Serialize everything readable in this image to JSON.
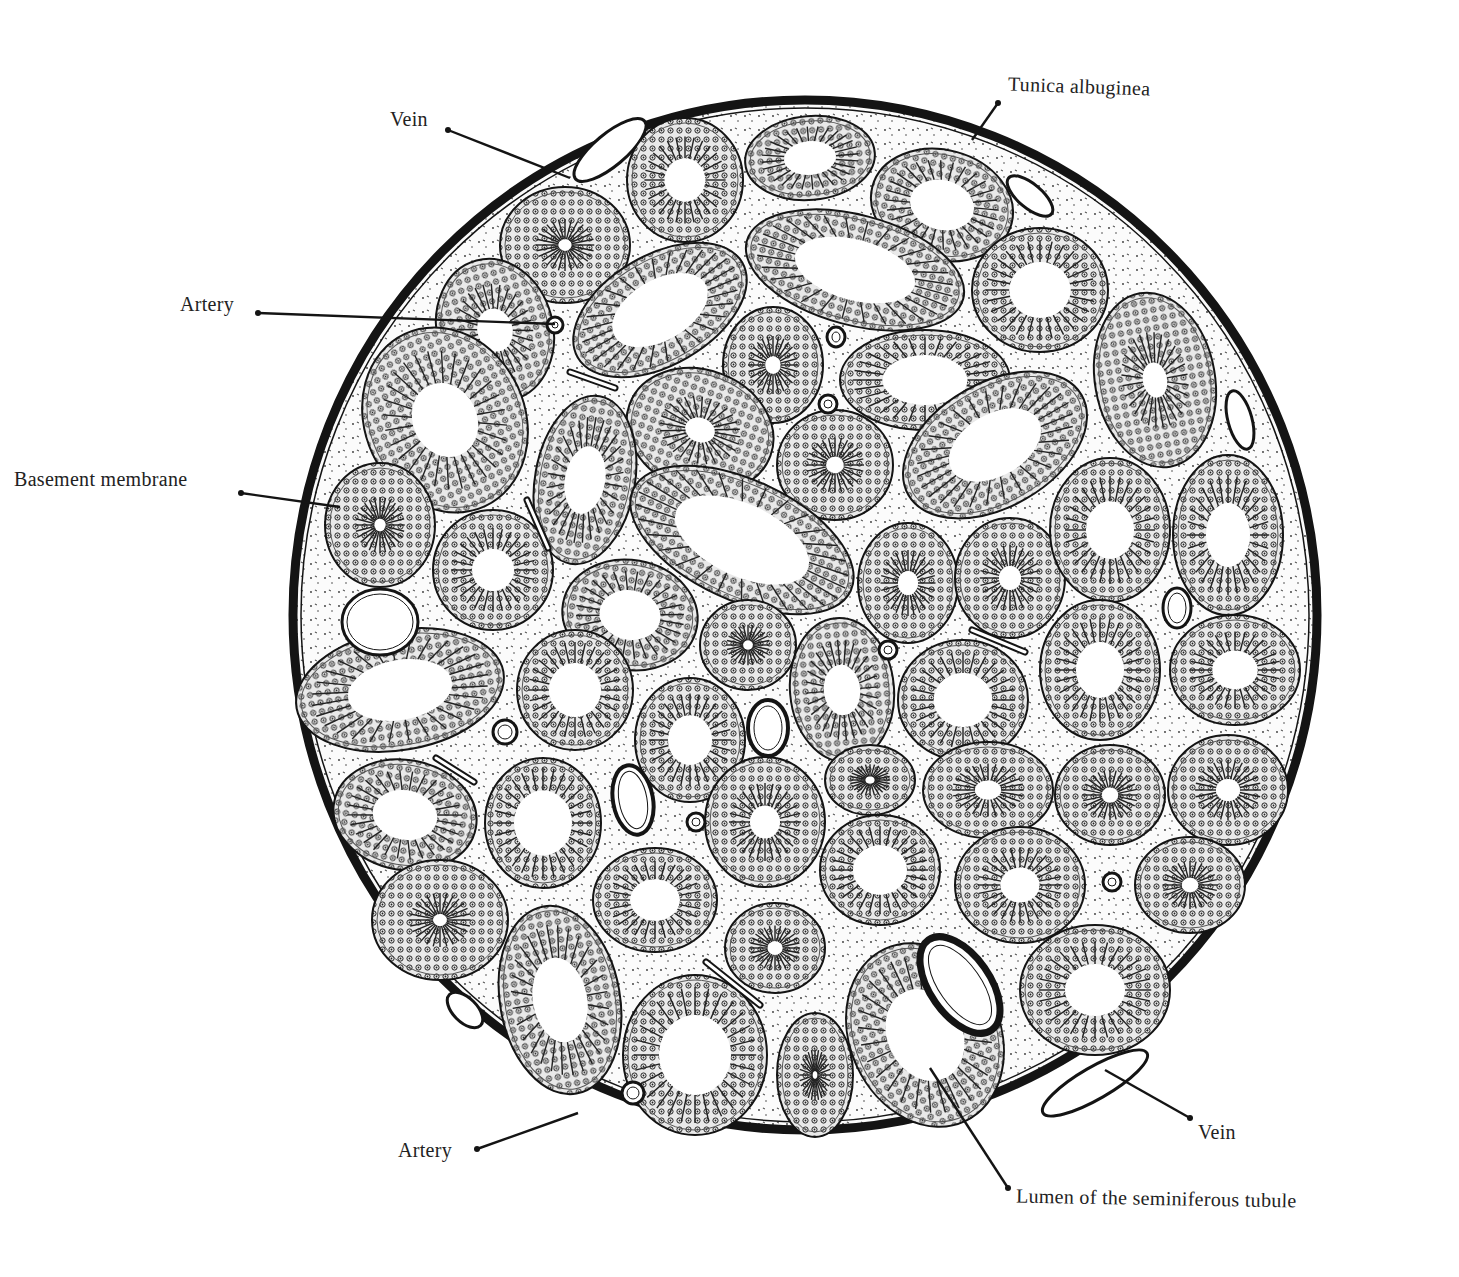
{
  "figure": {
    "background": "#ffffff",
    "ink": "#141414",
    "stroma_fill": "#fbfbfb",
    "capsule": {
      "cx": 805,
      "cy": 615,
      "rx": 512,
      "ry": 515,
      "stroke_width": 9
    }
  },
  "labels": [
    {
      "id": "vein-top",
      "text": "Vein",
      "x": 390,
      "y": 108,
      "line": [
        448,
        130,
        570,
        178
      ]
    },
    {
      "id": "tunica-albuginea",
      "text": "Tunica albuginea",
      "x": 1008,
      "y": 75,
      "line": [
        998,
        103,
        972,
        140
      ]
    },
    {
      "id": "artery-top",
      "text": "Artery",
      "x": 180,
      "y": 293,
      "line": [
        258,
        313,
        555,
        324
      ]
    },
    {
      "id": "basement-membrane",
      "text": "Basement membrane",
      "x": 14,
      "y": 468,
      "line": [
        241,
        493,
        340,
        507
      ]
    },
    {
      "id": "artery-bottom",
      "text": "Artery",
      "x": 398,
      "y": 1139,
      "line": [
        477,
        1149,
        578,
        1113
      ]
    },
    {
      "id": "vein-bottom",
      "text": "Vein",
      "x": 1198,
      "y": 1121,
      "line": [
        1190,
        1118,
        1105,
        1070
      ]
    },
    {
      "id": "lumen",
      "text": "Lumen of the seminiferous tubule",
      "x": 1016,
      "y": 1187,
      "line": [
        1008,
        1188,
        930,
        1068
      ]
    }
  ],
  "tubules": [
    {
      "cx": 685,
      "cy": 180,
      "rx": 58,
      "ry": 62,
      "rot": 0,
      "lumen": 0.35
    },
    {
      "cx": 810,
      "cy": 158,
      "rx": 65,
      "ry": 42,
      "rot": -5,
      "lumen": 0.4
    },
    {
      "cx": 942,
      "cy": 205,
      "rx": 72,
      "ry": 55,
      "rot": 15,
      "lumen": 0.45
    },
    {
      "cx": 565,
      "cy": 245,
      "rx": 65,
      "ry": 58,
      "rot": 0,
      "lumen": 0.1
    },
    {
      "cx": 855,
      "cy": 270,
      "rx": 112,
      "ry": 55,
      "rot": 15,
      "lumen": 0.55
    },
    {
      "cx": 1040,
      "cy": 290,
      "rx": 68,
      "ry": 62,
      "rot": 0,
      "lumen": 0.45
    },
    {
      "cx": 660,
      "cy": 310,
      "rx": 95,
      "ry": 55,
      "rot": -30,
      "lumen": 0.55
    },
    {
      "cx": 495,
      "cy": 330,
      "rx": 58,
      "ry": 72,
      "rot": -15,
      "lumen": 0.3
    },
    {
      "cx": 773,
      "cy": 365,
      "rx": 50,
      "ry": 58,
      "rot": 0,
      "lumen": 0.15
    },
    {
      "cx": 925,
      "cy": 380,
      "rx": 85,
      "ry": 50,
      "rot": 0,
      "lumen": 0.5
    },
    {
      "cx": 1155,
      "cy": 380,
      "rx": 60,
      "ry": 88,
      "rot": -10,
      "lumen": 0.2
    },
    {
      "cx": 445,
      "cy": 420,
      "rx": 80,
      "ry": 95,
      "rot": -25,
      "lumen": 0.4
    },
    {
      "cx": 700,
      "cy": 430,
      "rx": 75,
      "ry": 60,
      "rot": 20,
      "lumen": 0.2
    },
    {
      "cx": 585,
      "cy": 480,
      "rx": 50,
      "ry": 85,
      "rot": 10,
      "lumen": 0.4
    },
    {
      "cx": 835,
      "cy": 465,
      "rx": 58,
      "ry": 55,
      "rot": 0,
      "lumen": 0.15
    },
    {
      "cx": 995,
      "cy": 445,
      "rx": 100,
      "ry": 62,
      "rot": -30,
      "lumen": 0.5
    },
    {
      "cx": 742,
      "cy": 540,
      "rx": 120,
      "ry": 60,
      "rot": 25,
      "lumen": 0.6
    },
    {
      "cx": 380,
      "cy": 525,
      "rx": 55,
      "ry": 62,
      "rot": 0,
      "lumen": 0.1
    },
    {
      "cx": 493,
      "cy": 570,
      "rx": 60,
      "ry": 60,
      "rot": 0,
      "lumen": 0.35
    },
    {
      "cx": 908,
      "cy": 583,
      "rx": 50,
      "ry": 60,
      "rot": 0,
      "lumen": 0.2
    },
    {
      "cx": 1010,
      "cy": 578,
      "rx": 55,
      "ry": 60,
      "rot": 0,
      "lumen": 0.2
    },
    {
      "cx": 1110,
      "cy": 530,
      "rx": 60,
      "ry": 72,
      "rot": 0,
      "lumen": 0.4
    },
    {
      "cx": 1228,
      "cy": 535,
      "rx": 55,
      "ry": 80,
      "rot": 0,
      "lumen": 0.4
    },
    {
      "cx": 630,
      "cy": 615,
      "rx": 68,
      "ry": 55,
      "rot": 10,
      "lumen": 0.45
    },
    {
      "cx": 748,
      "cy": 645,
      "rx": 48,
      "ry": 45,
      "rot": 0,
      "lumen": 0.1
    },
    {
      "cx": 842,
      "cy": 690,
      "rx": 52,
      "ry": 72,
      "rot": -5,
      "lumen": 0.35
    },
    {
      "cx": 400,
      "cy": 690,
      "rx": 105,
      "ry": 60,
      "rot": -10,
      "lumen": 0.5
    },
    {
      "cx": 575,
      "cy": 690,
      "rx": 58,
      "ry": 60,
      "rot": 0,
      "lumen": 0.45
    },
    {
      "cx": 690,
      "cy": 740,
      "rx": 55,
      "ry": 62,
      "rot": 0,
      "lumen": 0.4
    },
    {
      "cx": 963,
      "cy": 700,
      "rx": 65,
      "ry": 60,
      "rot": 0,
      "lumen": 0.45
    },
    {
      "cx": 1100,
      "cy": 670,
      "rx": 60,
      "ry": 70,
      "rot": 0,
      "lumen": 0.4
    },
    {
      "cx": 1235,
      "cy": 670,
      "rx": 65,
      "ry": 55,
      "rot": 0,
      "lumen": 0.35
    },
    {
      "cx": 870,
      "cy": 780,
      "rx": 45,
      "ry": 35,
      "rot": 0,
      "lumen": 0.1
    },
    {
      "cx": 405,
      "cy": 815,
      "rx": 72,
      "ry": 55,
      "rot": 10,
      "lumen": 0.45
    },
    {
      "cx": 543,
      "cy": 823,
      "rx": 58,
      "ry": 65,
      "rot": 0,
      "lumen": 0.5
    },
    {
      "cx": 765,
      "cy": 822,
      "rx": 60,
      "ry": 65,
      "rot": 0,
      "lumen": 0.25
    },
    {
      "cx": 988,
      "cy": 790,
      "rx": 65,
      "ry": 48,
      "rot": 0,
      "lumen": 0.2
    },
    {
      "cx": 1110,
      "cy": 795,
      "rx": 55,
      "ry": 50,
      "rot": 0,
      "lumen": 0.15
    },
    {
      "cx": 1228,
      "cy": 790,
      "rx": 60,
      "ry": 55,
      "rot": 0,
      "lumen": 0.2
    },
    {
      "cx": 880,
      "cy": 870,
      "rx": 60,
      "ry": 55,
      "rot": 0,
      "lumen": 0.45
    },
    {
      "cx": 655,
      "cy": 900,
      "rx": 62,
      "ry": 52,
      "rot": 0,
      "lumen": 0.4
    },
    {
      "cx": 1020,
      "cy": 885,
      "rx": 65,
      "ry": 58,
      "rot": 0,
      "lumen": 0.3
    },
    {
      "cx": 1190,
      "cy": 885,
      "rx": 55,
      "ry": 48,
      "rot": 0,
      "lumen": 0.15
    },
    {
      "cx": 440,
      "cy": 920,
      "rx": 68,
      "ry": 60,
      "rot": 0,
      "lumen": 0.1
    },
    {
      "cx": 775,
      "cy": 948,
      "rx": 50,
      "ry": 45,
      "rot": 0,
      "lumen": 0.15
    },
    {
      "cx": 560,
      "cy": 1000,
      "rx": 60,
      "ry": 95,
      "rot": -10,
      "lumen": 0.45
    },
    {
      "cx": 695,
      "cy": 1055,
      "rx": 72,
      "ry": 80,
      "rot": 0,
      "lumen": 0.5
    },
    {
      "cx": 815,
      "cy": 1075,
      "rx": 38,
      "ry": 62,
      "rot": 0,
      "lumen": 0.05
    },
    {
      "cx": 925,
      "cy": 1035,
      "rx": 75,
      "ry": 95,
      "rot": -25,
      "lumen": 0.5
    },
    {
      "cx": 1095,
      "cy": 990,
      "rx": 75,
      "ry": 65,
      "rot": 0,
      "lumen": 0.4
    }
  ],
  "vessels": [
    {
      "type": "vein",
      "cx": 380,
      "cy": 622,
      "rx": 38,
      "ry": 33,
      "rot": 0,
      "wall": 3
    },
    {
      "type": "vein",
      "cx": 768,
      "cy": 728,
      "rx": 20,
      "ry": 28,
      "rot": 0,
      "wall": 4
    },
    {
      "type": "vein",
      "cx": 633,
      "cy": 800,
      "rx": 20,
      "ry": 35,
      "rot": -10,
      "wall": 4
    },
    {
      "type": "vein",
      "cx": 960,
      "cy": 985,
      "rx": 30,
      "ry": 55,
      "rot": -35,
      "wall": 7
    },
    {
      "type": "vein",
      "cx": 1177,
      "cy": 608,
      "rx": 14,
      "ry": 20,
      "rot": 0,
      "wall": 3
    },
    {
      "type": "artery",
      "cx": 555,
      "cy": 325,
      "rx": 8,
      "ry": 8,
      "rot": 0,
      "wall": 3
    },
    {
      "type": "artery",
      "cx": 836,
      "cy": 337,
      "rx": 9,
      "ry": 10,
      "rot": 0,
      "wall": 3
    },
    {
      "type": "artery",
      "cx": 828,
      "cy": 404,
      "rx": 9,
      "ry": 9,
      "rot": 0,
      "wall": 3
    },
    {
      "type": "artery",
      "cx": 888,
      "cy": 650,
      "rx": 9,
      "ry": 9,
      "rot": 0,
      "wall": 3
    },
    {
      "type": "artery",
      "cx": 505,
      "cy": 732,
      "rx": 12,
      "ry": 12,
      "rot": 0,
      "wall": 3
    },
    {
      "type": "artery",
      "cx": 696,
      "cy": 822,
      "rx": 9,
      "ry": 9,
      "rot": 0,
      "wall": 3
    },
    {
      "type": "artery",
      "cx": 1112,
      "cy": 882,
      "rx": 9,
      "ry": 9,
      "rot": 0,
      "wall": 3
    },
    {
      "type": "artery",
      "cx": 633,
      "cy": 1093,
      "rx": 11,
      "ry": 11,
      "rot": 0,
      "wall": 3
    }
  ],
  "capsule_veins": [
    {
      "cx": 610,
      "cy": 150,
      "rx": 45,
      "ry": 16,
      "rot": -40
    },
    {
      "cx": 1030,
      "cy": 196,
      "rx": 28,
      "ry": 12,
      "rot": 40
    },
    {
      "cx": 465,
      "cy": 1010,
      "rx": 22,
      "ry": 12,
      "rot": 45
    },
    {
      "cx": 1095,
      "cy": 1083,
      "rx": 60,
      "ry": 16,
      "rot": -30
    },
    {
      "cx": 1240,
      "cy": 420,
      "rx": 12,
      "ry": 30,
      "rot": -15
    }
  ],
  "capillaries": [
    {
      "x1": 570,
      "y1": 372,
      "x2": 615,
      "y2": 388
    },
    {
      "x1": 527,
      "y1": 500,
      "x2": 548,
      "y2": 548
    },
    {
      "x1": 436,
      "y1": 758,
      "x2": 474,
      "y2": 782
    },
    {
      "x1": 706,
      "y1": 962,
      "x2": 760,
      "y2": 1005
    },
    {
      "x1": 972,
      "y1": 630,
      "x2": 1025,
      "y2": 652
    }
  ]
}
